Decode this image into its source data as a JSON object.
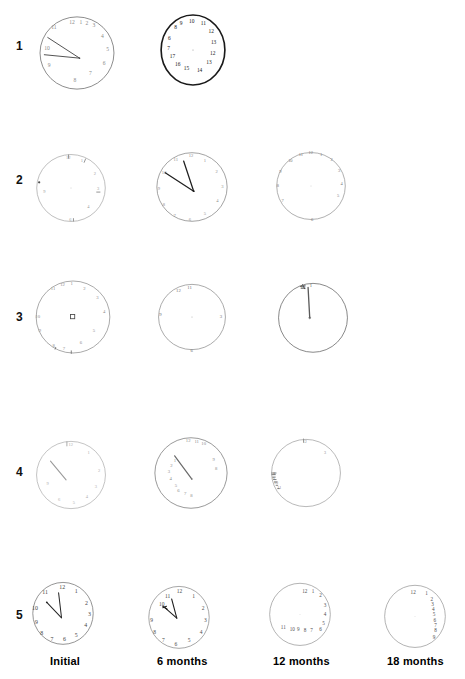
{
  "figure": {
    "type": "clock-drawing-test-grid",
    "rows": 5,
    "columns": 4,
    "background_color": "#ffffff",
    "ink_color": "#333333"
  },
  "row_labels": [
    {
      "id": "row-1",
      "label": "1"
    },
    {
      "id": "row-2",
      "label": "2"
    },
    {
      "id": "row-3",
      "label": "3"
    },
    {
      "id": "row-4",
      "label": "4"
    },
    {
      "id": "row-5",
      "label": "5"
    }
  ],
  "column_labels": [
    {
      "id": "col-initial",
      "label": "Initial"
    },
    {
      "id": "col-6-months",
      "label": "6  months"
    },
    {
      "id": "col-12-months",
      "label": "12 months"
    },
    {
      "id": "col-18-months",
      "label": "18 months"
    }
  ],
  "clocks": [
    {
      "id": "clock-r1c1",
      "row": "1",
      "column": "Initial",
      "present": true,
      "stroke_weight": "light",
      "has_hands": true,
      "hands": [
        {
          "name": "long-hand",
          "angle_deg": 255,
          "length_ratio": 0.72
        },
        {
          "name": "short-hand",
          "angle_deg": 293,
          "length_ratio": 0.62
        }
      ],
      "numbers": [
        "11",
        "12",
        "1",
        "2",
        "3",
        "4",
        "5",
        "6",
        "7",
        "8",
        "9",
        "10"
      ],
      "numbers_crowded_at": "top",
      "note": "numbers compressed into upper arc; hands point left"
    },
    {
      "id": "clock-r1c2",
      "row": "1",
      "column": "6  months",
      "present": true,
      "stroke_weight": "heavy",
      "has_hands": false,
      "numbers": [
        "10",
        "9",
        "8",
        "11",
        "12",
        "13",
        "14",
        "15",
        "16",
        "17",
        "7",
        "6"
      ],
      "numbers_crowded_at": "perimeter",
      "note": "dark heavy circle, numerals run counterclockwise and exceed 12"
    },
    {
      "id": "clock-r1c3",
      "row": "1",
      "column": "12 months",
      "present": false,
      "note": "no drawing produced"
    },
    {
      "id": "clock-r1c4",
      "row": "1",
      "column": "18 months",
      "present": false,
      "note": "no drawing produced"
    },
    {
      "id": "clock-r2c1",
      "row": "2",
      "column": "Initial",
      "present": true,
      "stroke_weight": "very-light",
      "has_hands": false,
      "numbers": [
        "12",
        "1",
        "2",
        "3",
        "9",
        "6"
      ],
      "numbers_crowded_at": "sparse",
      "note": "faint circle with a few scattered tick marks"
    },
    {
      "id": "clock-r2c2",
      "row": "2",
      "column": "6  months",
      "present": true,
      "stroke_weight": "light",
      "has_hands": true,
      "hands": [
        {
          "name": "long-hand",
          "angle_deg": 200,
          "length_ratio": 0.62
        },
        {
          "name": "short-hand",
          "angle_deg": 253,
          "length_ratio": 0.6
        }
      ],
      "numbers": [
        "12",
        "11",
        "10",
        "9",
        "8",
        "7",
        "6",
        "5",
        "4",
        "3",
        "2",
        "1"
      ],
      "numbers_crowded_at": "even",
      "note": "both hands converge toward upper left"
    },
    {
      "id": "clock-r2c3",
      "row": "2",
      "column": "12 months",
      "present": true,
      "stroke_weight": "light",
      "has_hands": false,
      "numbers": [
        "11",
        "12",
        "1",
        "2",
        "3",
        "4",
        "5",
        "6",
        "7",
        "8",
        "9",
        "10"
      ],
      "numbers_crowded_at": "top",
      "note": "circle with faint numerals, no hands"
    },
    {
      "id": "clock-r2c4",
      "row": "2",
      "column": "18 months",
      "present": false,
      "note": "no drawing produced"
    },
    {
      "id": "clock-r3c1",
      "row": "3",
      "column": "Initial",
      "present": true,
      "stroke_weight": "light",
      "has_hands": false,
      "has_center_mark": true,
      "numbers": [
        "11",
        "12",
        "1",
        "2",
        "3",
        "4",
        "5",
        "6",
        "7",
        "8",
        "9",
        "10"
      ],
      "numbers_crowded_at": "perimeter",
      "note": "small square scribble drawn at the centre of the dial"
    },
    {
      "id": "clock-r3c2",
      "row": "3",
      "column": "6  months",
      "present": true,
      "stroke_weight": "light",
      "has_hands": false,
      "numbers": [
        "11",
        "9",
        "3",
        "6"
      ],
      "numbers_crowded_at": "sparse",
      "note": "nearly empty circle, only a few numerals"
    },
    {
      "id": "clock-r3c3",
      "row": "3",
      "column": "12 months",
      "present": true,
      "stroke_weight": "medium",
      "has_hands": true,
      "hands": [
        {
          "name": "single-hand",
          "angle_deg": 270,
          "length_ratio": 0.95
        }
      ],
      "numbers": [
        "12"
      ],
      "numbers_crowded_at": "top",
      "note": "single long vertical stroke from centre up to 12 with scribble at top"
    },
    {
      "id": "clock-r3c4",
      "row": "3",
      "column": "18 months",
      "present": false,
      "note": "no drawing produced"
    },
    {
      "id": "clock-r4c1",
      "row": "4",
      "column": "Initial",
      "present": true,
      "stroke_weight": "very-light",
      "has_hands": true,
      "hands": [
        {
          "name": "single-hand",
          "angle_deg": 218,
          "length_ratio": 0.6
        }
      ],
      "numbers": [
        "12",
        "1",
        "2",
        "3",
        "4",
        "5",
        "6",
        "9"
      ],
      "numbers_crowded_at": "sparse",
      "note": "one faint hand toward upper left"
    },
    {
      "id": "clock-r4c2",
      "row": "4",
      "column": "6  months",
      "present": true,
      "stroke_weight": "light",
      "has_hands": true,
      "hands": [
        {
          "name": "single-hand",
          "angle_deg": 215,
          "length_ratio": 0.62
        }
      ],
      "numbers": [
        "12",
        "11",
        "10",
        "9",
        "8",
        "7",
        "6",
        "5",
        "4",
        "3",
        "2",
        "1"
      ],
      "numbers_crowded_at": "left",
      "note": "numerals bunched into left half of dial"
    },
    {
      "id": "clock-r4c3",
      "row": "4",
      "column": "12 months",
      "present": true,
      "stroke_weight": "very-light",
      "has_hands": false,
      "numbers": [
        "12",
        "3",
        "8",
        "9",
        "10",
        "11"
      ],
      "numbers_crowded_at": "left",
      "note": "smudged cluster of marks along the left edge"
    },
    {
      "id": "clock-r4c4",
      "row": "4",
      "column": "18 months",
      "present": false,
      "note": "no drawing produced"
    },
    {
      "id": "clock-r5c1",
      "row": "5",
      "column": "Initial",
      "present": true,
      "stroke_weight": "medium",
      "has_hands": true,
      "hands": [
        {
          "name": "long-hand",
          "angle_deg": 252,
          "length_ratio": 0.58
        },
        {
          "name": "short-hand",
          "angle_deg": 290,
          "length_ratio": 0.55
        }
      ],
      "numbers": [
        "12",
        "1",
        "2",
        "3",
        "4",
        "5",
        "6",
        "7",
        "8",
        "9",
        "10",
        "11"
      ],
      "numbers_crowded_at": "even",
      "note": "well-formed clock, all twelve numerals, hands near 11:50"
    },
    {
      "id": "clock-r5c2",
      "row": "5",
      "column": "6  months",
      "present": true,
      "stroke_weight": "medium",
      "has_hands": true,
      "hands": [
        {
          "name": "long-hand",
          "angle_deg": 250,
          "length_ratio": 0.52
        },
        {
          "name": "short-hand",
          "angle_deg": 285,
          "length_ratio": 0.48
        }
      ],
      "numbers": [
        "12",
        "1",
        "2",
        "3",
        "4",
        "5",
        "6",
        "7",
        "8",
        "9",
        "10",
        "11"
      ],
      "numbers_crowded_at": "even",
      "note": "numerals still complete, hands shorter and scribbled"
    },
    {
      "id": "clock-r5c3",
      "row": "5",
      "column": "12 months",
      "present": true,
      "stroke_weight": "light",
      "has_hands": false,
      "numbers": [
        "12",
        "1",
        "2",
        "3",
        "4",
        "5",
        "6",
        "7",
        "8",
        "9",
        "10",
        "11"
      ],
      "numbers_crowded_at": "right-and-bottom",
      "note": "numerals drift to right side then trail along the bottom"
    },
    {
      "id": "clock-r5c4",
      "row": "5",
      "column": "18 months",
      "present": true,
      "stroke_weight": "light",
      "has_hands": false,
      "numbers": [
        "12",
        "1",
        "2",
        "3",
        "4",
        "5",
        "6",
        "7",
        "8",
        "9"
      ],
      "numbers_crowded_at": "right-column",
      "note": "numerals stacked in a vertical column down the right side"
    }
  ]
}
